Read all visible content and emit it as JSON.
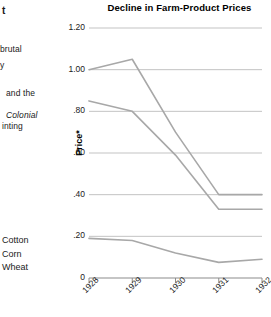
{
  "page_text": {
    "fragments": [
      {
        "text": "t",
        "x": 2,
        "y": 6,
        "style": "bold"
      },
      {
        "text": "brutal",
        "x": 0,
        "y": 44,
        "style": "normal"
      },
      {
        "text": "y",
        "x": 0,
        "y": 60,
        "style": "normal"
      },
      {
        "text": "and the",
        "x": 6,
        "y": 88,
        "style": "normal"
      },
      {
        "text": "Colonial",
        "x": 6,
        "y": 110,
        "style": "italic"
      },
      {
        "text": "inting",
        "x": 2,
        "y": 121,
        "style": "normal"
      }
    ]
  },
  "legend": {
    "position": "left-margin",
    "items": [
      {
        "label": "Cotton",
        "color": "#a8a8a8"
      },
      {
        "label": "Corn",
        "color": "#a8a8a8"
      },
      {
        "label": "Wheat",
        "color": "#a8a8a8"
      }
    ]
  },
  "chart_data": {
    "type": "line",
    "title": "Decline in Farm-Product Prices",
    "xlabel": "",
    "ylabel": "Price*",
    "x": [
      "1928",
      "1929",
      "1930",
      "1931",
      "1932"
    ],
    "categories": [
      "1928",
      "1929",
      "1930",
      "1931",
      "1932"
    ],
    "series": [
      {
        "name": "Cotton",
        "values": [
          1.0,
          1.05,
          0.7,
          0.4,
          0.4
        ],
        "color": "#a8a8a8"
      },
      {
        "name": "Corn",
        "values": [
          0.85,
          0.8,
          0.59,
          0.33,
          0.33
        ],
        "color": "#a8a8a8"
      },
      {
        "name": "Wheat",
        "values": [
          0.19,
          0.18,
          0.12,
          0.075,
          0.09
        ],
        "color": "#a8a8a8"
      }
    ],
    "ylim": [
      0,
      1.2
    ],
    "yticks": [
      0,
      0.2,
      0.4,
      0.6,
      0.8,
      1.0,
      1.2
    ],
    "ytick_labels": [
      "0",
      ".20",
      ".40",
      ".60",
      ".80",
      "1.00",
      "1.20"
    ],
    "xtick_labels": [
      "1928",
      "1929",
      "1930",
      "1931",
      "1932"
    ],
    "grid": true,
    "grid_color": "#b4b4b4",
    "axis_color": "#8c8c8c",
    "line_width": 1.6,
    "legend_position": "left-margin",
    "footnote_marker": "*"
  },
  "colors": {
    "line": "#a8a8a8",
    "grid": "#b4b4b4",
    "axis": "#8c8c8c",
    "text": "#1a1a1a",
    "background": "#ffffff"
  }
}
